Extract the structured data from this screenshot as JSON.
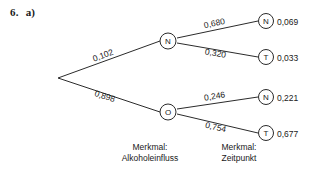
{
  "exercise": {
    "number": "6.",
    "part": "a)"
  },
  "tree": {
    "root": {
      "id": "root"
    },
    "level1": [
      {
        "id": "n1",
        "letter": "N",
        "weight": "0,102"
      },
      {
        "id": "o1",
        "letter": "O",
        "weight": "0,898"
      }
    ],
    "leaves": [
      {
        "id": "n1-n",
        "letter": "N",
        "weight": "0,680",
        "value": "0,069"
      },
      {
        "id": "n1-t",
        "letter": "T",
        "weight": "0,320",
        "value": "0,033"
      },
      {
        "id": "o1-n",
        "letter": "N",
        "weight": "0,246",
        "value": "0,221"
      },
      {
        "id": "o1-t",
        "letter": "T",
        "weight": "0,754",
        "value": "0,677"
      }
    ]
  },
  "captions": {
    "left_line1": "Merkmal:",
    "left_line2": "Alkoholeinfluss",
    "right_line1": "Merkmal:",
    "right_line2": "Zeitpunkt"
  },
  "colors": {
    "ink": "#2b2b2b",
    "background": "#ffffff"
  }
}
